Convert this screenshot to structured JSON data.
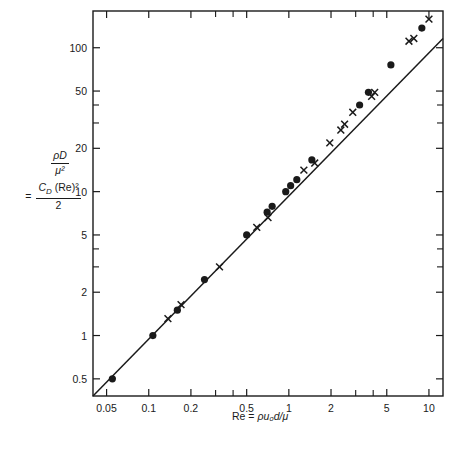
{
  "chart_data": {
    "type": "scatter",
    "title": "",
    "xlabel": "Re = ρu₀d/μ",
    "ylabel": "ρD/μ² = C_D(Re)²/2",
    "xscale": "log",
    "yscale": "log",
    "xlim": [
      0.04,
      12.6
    ],
    "ylim": [
      0.38,
      180
    ],
    "grid": false,
    "legend": null,
    "x_ticks": [
      0.05,
      0.1,
      0.2,
      0.5,
      1,
      2,
      5,
      10
    ],
    "x_tick_labels": [
      "0.05",
      "0.1",
      "0.2",
      "0.5",
      "1",
      "2",
      "5",
      "10"
    ],
    "x_minor_ticks": [
      0.3,
      0.4,
      3,
      4
    ],
    "y_ticks": [
      0.5,
      1,
      2,
      5,
      10,
      20,
      50,
      100
    ],
    "y_tick_labels": [
      "0.5",
      "1",
      "2",
      "5",
      "10",
      "20",
      "50",
      "100"
    ],
    "y_minor_ticks": [
      3,
      4,
      30,
      40
    ],
    "series": [
      {
        "name": "dots",
        "marker": "filled-circle",
        "x": [
          0.055,
          0.107,
          0.16,
          0.25,
          0.5,
          0.7,
          0.76,
          0.95,
          1.03,
          1.14,
          1.46,
          3.2,
          3.7,
          5.35,
          8.9
        ],
        "y": [
          0.5,
          1.0,
          1.5,
          2.45,
          5.0,
          7.2,
          7.9,
          10.0,
          11.0,
          12.1,
          16.6,
          40,
          49,
          76,
          137
        ]
      },
      {
        "name": "crosses",
        "marker": "cross",
        "x": [
          0.137,
          0.17,
          0.32,
          0.59,
          0.71,
          1.28,
          1.53,
          1.96,
          2.35,
          2.5,
          2.86,
          3.9,
          4.1,
          7.2,
          7.8,
          10.0
        ],
        "y": [
          1.31,
          1.64,
          3.0,
          5.65,
          6.6,
          14.1,
          15.8,
          21.8,
          26.8,
          29.4,
          35.6,
          45.9,
          49,
          111,
          116,
          158
        ]
      },
      {
        "name": "theory-line",
        "marker": "line",
        "x": [
          0.04,
          12.6
        ],
        "y": [
          0.38,
          116
        ]
      }
    ]
  },
  "labels": {
    "y_num": "ρD",
    "y_den": "μ²",
    "y_eq": "=",
    "y2_num_cd": "C",
    "y2_num_sub": "D",
    "y2_num_rest": " (Re)²",
    "y2_den": "2",
    "x_pre": "Re = ",
    "x_expr": "ρu₀d/μ"
  }
}
